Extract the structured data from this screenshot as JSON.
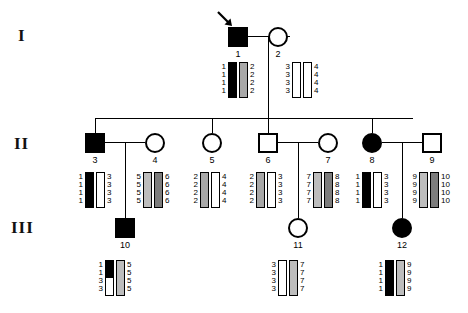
{
  "figure": {
    "type": "pedigree-haplotype-chart",
    "generations": [
      {
        "label": "I"
      },
      {
        "label": "II"
      },
      {
        "label": "III"
      }
    ],
    "legend_note": "Filled symbols = affected; bars = haplotypes across 4 linked markers"
  },
  "individuals": [
    {
      "id": "1",
      "generation": "I",
      "sex": "male",
      "affected": true,
      "proband": true,
      "haplotypes": [
        {
          "alleles": [
            "1",
            "1",
            "1",
            "1"
          ],
          "fills": [
            "black",
            "black",
            "black",
            "black"
          ]
        },
        {
          "alleles": [
            "2",
            "2",
            "2",
            "2"
          ],
          "fills": [
            "gray",
            "gray",
            "gray",
            "gray"
          ]
        }
      ]
    },
    {
      "id": "2",
      "generation": "I",
      "sex": "female",
      "affected": false,
      "proband": false,
      "haplotypes": [
        {
          "alleles": [
            "3",
            "3",
            "3",
            "3"
          ],
          "fills": [
            "white",
            "white",
            "white",
            "white"
          ]
        },
        {
          "alleles": [
            "4",
            "4",
            "4",
            "4"
          ],
          "fills": [
            "white",
            "white",
            "white",
            "white"
          ]
        }
      ]
    },
    {
      "id": "3",
      "generation": "II",
      "sex": "male",
      "affected": true,
      "proband": false,
      "haplotypes": [
        {
          "alleles": [
            "1",
            "1",
            "1",
            "1"
          ],
          "fills": [
            "black",
            "black",
            "black",
            "black"
          ]
        },
        {
          "alleles": [
            "3",
            "3",
            "3",
            "3"
          ],
          "fills": [
            "white",
            "white",
            "white",
            "white"
          ]
        }
      ]
    },
    {
      "id": "4",
      "generation": "II",
      "sex": "female",
      "affected": false,
      "proband": false,
      "haplotypes": [
        {
          "alleles": [
            "5",
            "5",
            "5",
            "5"
          ],
          "fills": [
            "gray-l",
            "gray-l",
            "gray-l",
            "gray-l"
          ]
        },
        {
          "alleles": [
            "6",
            "6",
            "6",
            "6"
          ],
          "fills": [
            "gray-d",
            "gray-d",
            "gray-d",
            "gray-d"
          ]
        }
      ]
    },
    {
      "id": "5",
      "generation": "II",
      "sex": "female",
      "affected": false,
      "proband": false,
      "haplotypes": [
        {
          "alleles": [
            "2",
            "2",
            "2",
            "2"
          ],
          "fills": [
            "gray",
            "gray",
            "gray",
            "gray"
          ]
        },
        {
          "alleles": [
            "4",
            "4",
            "4",
            "4"
          ],
          "fills": [
            "white",
            "white",
            "white",
            "white"
          ]
        }
      ]
    },
    {
      "id": "6",
      "generation": "II",
      "sex": "male",
      "affected": false,
      "proband": false,
      "haplotypes": [
        {
          "alleles": [
            "2",
            "2",
            "2",
            "2"
          ],
          "fills": [
            "gray",
            "gray",
            "gray",
            "gray"
          ]
        },
        {
          "alleles": [
            "3",
            "3",
            "3",
            "3"
          ],
          "fills": [
            "white",
            "white",
            "white",
            "white"
          ]
        }
      ]
    },
    {
      "id": "7",
      "generation": "II",
      "sex": "female",
      "affected": false,
      "proband": false,
      "haplotypes": [
        {
          "alleles": [
            "7",
            "7",
            "7",
            "7"
          ],
          "fills": [
            "gray-l",
            "gray-l",
            "gray-l",
            "gray-l"
          ]
        },
        {
          "alleles": [
            "8",
            "8",
            "8",
            "8"
          ],
          "fills": [
            "gray-d",
            "gray-d",
            "gray-d",
            "gray-d"
          ]
        }
      ]
    },
    {
      "id": "8",
      "generation": "II",
      "sex": "female",
      "affected": true,
      "proband": false,
      "haplotypes": [
        {
          "alleles": [
            "1",
            "1",
            "1",
            "1"
          ],
          "fills": [
            "black",
            "black",
            "black",
            "black"
          ]
        },
        {
          "alleles": [
            "3",
            "3",
            "3",
            "3"
          ],
          "fills": [
            "white",
            "white",
            "white",
            "white"
          ]
        }
      ]
    },
    {
      "id": "9",
      "generation": "II",
      "sex": "male",
      "affected": false,
      "proband": false,
      "haplotypes": [
        {
          "alleles": [
            "9",
            "9",
            "9",
            "9"
          ],
          "fills": [
            "gray-l",
            "gray-l",
            "gray-l",
            "gray-l"
          ]
        },
        {
          "alleles": [
            "10",
            "10",
            "10",
            "10"
          ],
          "fills": [
            "gray-d",
            "gray-d",
            "gray-d",
            "gray-d"
          ]
        }
      ]
    },
    {
      "id": "10",
      "generation": "III",
      "sex": "male",
      "affected": true,
      "proband": false,
      "recombinant": true,
      "haplotypes": [
        {
          "alleles": [
            "1",
            "1",
            "3",
            "3"
          ],
          "fills": [
            "black",
            "black",
            "white",
            "white"
          ]
        },
        {
          "alleles": [
            "5",
            "5",
            "5",
            "5"
          ],
          "fills": [
            "gray-l",
            "gray-l",
            "gray-l",
            "gray-l"
          ]
        }
      ]
    },
    {
      "id": "11",
      "generation": "III",
      "sex": "female",
      "affected": false,
      "proband": false,
      "haplotypes": [
        {
          "alleles": [
            "3",
            "3",
            "3",
            "3"
          ],
          "fills": [
            "white",
            "white",
            "white",
            "white"
          ]
        },
        {
          "alleles": [
            "7",
            "7",
            "7",
            "7"
          ],
          "fills": [
            "gray-l",
            "gray-l",
            "gray-l",
            "gray-l"
          ]
        }
      ]
    },
    {
      "id": "12",
      "generation": "III",
      "sex": "female",
      "affected": true,
      "proband": false,
      "haplotypes": [
        {
          "alleles": [
            "1",
            "1",
            "1",
            "1"
          ],
          "fills": [
            "black",
            "black",
            "black",
            "black"
          ]
        },
        {
          "alleles": [
            "9",
            "9",
            "9",
            "9"
          ],
          "fills": [
            "gray-l",
            "gray-l",
            "gray-l",
            "gray-l"
          ]
        }
      ]
    }
  ]
}
